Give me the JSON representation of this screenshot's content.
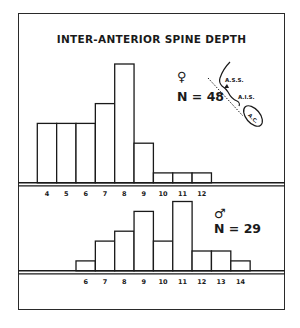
{
  "chart_data": [
    {
      "type": "bar",
      "title": "INTER-ANTERIOR SPINE DEPTH",
      "group": "female",
      "symbol": "♀",
      "n_label": "N = 48",
      "categories": [
        "4",
        "5",
        "6",
        "7",
        "8",
        "9",
        "10",
        "11",
        "12"
      ],
      "values": [
        6,
        6,
        6,
        8,
        12,
        4,
        1,
        1,
        1
      ],
      "xlabel": "",
      "ylabel": "",
      "grid": false,
      "histogram": true
    },
    {
      "type": "bar",
      "group": "male",
      "symbol": "♂",
      "n_label": "N = 29",
      "categories": [
        "6",
        "7",
        "8",
        "9",
        "10",
        "11",
        "12",
        "13",
        "14"
      ],
      "values": [
        1,
        3,
        4,
        6,
        3,
        7,
        2,
        2,
        1
      ],
      "xlabel": "",
      "ylabel": "",
      "grid": false,
      "histogram": true
    }
  ],
  "title": "INTER-ANTERIOR SPINE DEPTH",
  "female": {
    "symbol": "♀",
    "n_label": "N = 48"
  },
  "male": {
    "symbol": "♂",
    "n_label": "N = 29"
  },
  "inset_diagram": {
    "labels": {
      "ass": "A.S.S.",
      "ais": "A.I.S.",
      "ac": "A.C."
    }
  },
  "style": {
    "line_color": "#1a1a1a",
    "background": "#ffffff"
  }
}
